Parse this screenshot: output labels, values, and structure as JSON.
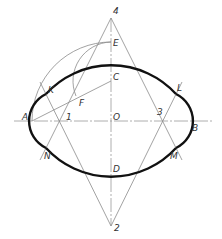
{
  "diagram": {
    "labels": {
      "A": "A",
      "B": "B",
      "C": "C",
      "D": "D",
      "E": "E",
      "F": "F",
      "K": "K",
      "L": "L",
      "M": "M",
      "N": "N",
      "O": "O",
      "p1": "1",
      "p2": "2",
      "p3": "3",
      "p4": "4"
    },
    "points": {
      "O": [
        111,
        121
      ],
      "A": [
        32,
        121
      ],
      "B": [
        191,
        121
      ],
      "C": [
        111,
        81
      ],
      "D": [
        111,
        161
      ],
      "E": [
        111,
        42
      ],
      "F": [
        76,
        96
      ],
      "K": [
        46,
        94
      ],
      "L": [
        176,
        94
      ],
      "M": [
        176,
        148
      ],
      "N": [
        46,
        148
      ],
      "1": [
        59,
        121
      ],
      "2": [
        111,
        226
      ],
      "3": [
        163,
        121
      ],
      "4": [
        111,
        18
      ]
    },
    "colors": {
      "outline": "#111111",
      "construction": "#8a8a8a",
      "text": "#333333"
    }
  }
}
